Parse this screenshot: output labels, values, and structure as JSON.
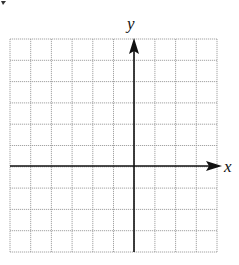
{
  "chart_data": {
    "type": "coordinate-grid",
    "title": "",
    "xlabel": "x",
    "ylabel": "y",
    "grid": true,
    "grid_columns": 10,
    "grid_rows": 10,
    "y_axis_column_index": 6,
    "x_axis_row_index": 6,
    "tick_labels": [],
    "series": []
  },
  "axes": {
    "x_label": "x",
    "y_label": "y"
  },
  "colors": {
    "grid": "#9a9a9a",
    "axis": "#111111",
    "background": "#ffffff"
  }
}
